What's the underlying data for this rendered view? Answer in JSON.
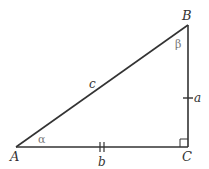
{
  "diagram": {
    "type": "right-triangle",
    "vertices": {
      "A": {
        "label": "A",
        "x": 16,
        "y": 147
      },
      "B": {
        "label": "B",
        "x": 188,
        "y": 25
      },
      "C": {
        "label": "C",
        "x": 188,
        "y": 147
      }
    },
    "sides": {
      "a": {
        "label": "a",
        "from": "B",
        "to": "C",
        "tick_marks": 1
      },
      "b": {
        "label": "b",
        "from": "A",
        "to": "C",
        "tick_marks": 2
      },
      "c": {
        "label": "c",
        "from": "A",
        "to": "B",
        "tick_marks": 0
      }
    },
    "angles": {
      "alpha": {
        "label": "α",
        "at": "A"
      },
      "beta": {
        "label": "β",
        "at": "B"
      },
      "right_angle": {
        "at": "C"
      }
    },
    "colors": {
      "line": "#333333",
      "greek_label": "#777777"
    }
  }
}
